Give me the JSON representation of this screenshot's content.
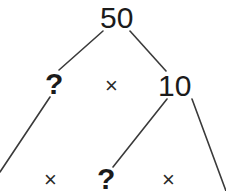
{
  "diagram": {
    "background_color": "#ffffff",
    "ink_color": "#1b1b1b",
    "edge_color": "#3a3a3a",
    "edge_width": 1.6,
    "width": 226,
    "height": 191,
    "nodes": [
      {
        "id": "root",
        "label": "50",
        "kind": "number",
        "x": 116,
        "y": 17,
        "level": 0
      },
      {
        "id": "l1-left",
        "label": "?",
        "kind": "unknown",
        "x": 52,
        "y": 83,
        "level": 1
      },
      {
        "id": "l1-op",
        "label": "×",
        "kind": "operator",
        "x": 113,
        "y": 86,
        "level": 1
      },
      {
        "id": "l1-right",
        "label": "10",
        "kind": "number",
        "x": 175,
        "y": 85,
        "level": 1
      },
      {
        "id": "l2-cut",
        "label": "",
        "kind": "clipped",
        "x": 2,
        "y": 181,
        "level": 2
      },
      {
        "id": "l2-op-left",
        "label": "×",
        "kind": "operator",
        "x": 52,
        "y": 180,
        "level": 2
      },
      {
        "id": "l2-unknown",
        "label": "?",
        "kind": "unknown",
        "x": 105,
        "y": 178,
        "level": 2
      },
      {
        "id": "l2-op-right",
        "label": "×",
        "kind": "operator",
        "x": 170,
        "y": 180,
        "level": 2
      },
      {
        "id": "l2-cut-right",
        "label": "",
        "kind": "clipped",
        "x": 225,
        "y": 190,
        "level": 2
      }
    ],
    "edges": [
      {
        "id": "edge-root-left",
        "from": "root",
        "to": "l1-left",
        "x1": 103,
        "y1": 31,
        "x2": 59,
        "y2": 70
      },
      {
        "id": "edge-root-right",
        "from": "root",
        "to": "l1-right",
        "x1": 130,
        "y1": 31,
        "x2": 166,
        "y2": 71
      },
      {
        "id": "edge-left-down",
        "from": "l1-left",
        "to": "l2-cut",
        "x1": 50,
        "y1": 97,
        "x2": 0,
        "y2": 172
      },
      {
        "id": "edge-ten-left",
        "from": "l1-right",
        "to": "l2-unknown",
        "x1": 167,
        "y1": 99,
        "x2": 113,
        "y2": 167
      },
      {
        "id": "edge-ten-right",
        "from": "l1-right",
        "to": "l2-cut-right",
        "x1": 192,
        "y1": 99,
        "x2": 226,
        "y2": 191
      }
    ],
    "legend": {
      "unknown_symbol": "?",
      "operator_symbol": "×",
      "values": [
        "50",
        "10"
      ]
    }
  }
}
